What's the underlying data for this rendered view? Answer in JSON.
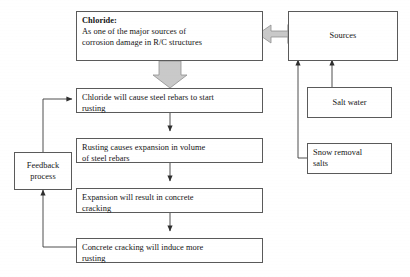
{
  "diagram": {
    "background_color": "#ffffff",
    "box_border_color": "#5a5a5a",
    "connector_color": "#3a3a3a",
    "block_arrow_fill": "#c9c9c9",
    "block_arrow_stroke": "#8a8a8a"
  },
  "chloride_box": {
    "heading": "Chloride:",
    "line1": "As one of the major sources of",
    "line2": "corrosion damage in R/C structures"
  },
  "sources_box": {
    "label": "Sources"
  },
  "salt_water_box": {
    "label": "Salt water"
  },
  "snow_removal_box": {
    "line1": "Snow removal",
    "line2": "salts"
  },
  "feedback_box": {
    "line1": "Feedback",
    "line2": "process"
  },
  "flow_steps": [
    {
      "id": "step-rusting-start",
      "line1": "Chloride will cause steel rebars to start",
      "line2": "rusting"
    },
    {
      "id": "step-expansion-volume",
      "line1": "Rusting causes expansion in volume",
      "line2": "of steel rebars"
    },
    {
      "id": "step-concrete-cracking",
      "line1": "Expansion will result in concrete",
      "line2": "cracking"
    },
    {
      "id": "step-induce-more-rusting",
      "line1": "Concrete cracking will induce more",
      "line2": "rusting"
    }
  ],
  "arrows": {
    "sources_to_chloride": "block-arrow-left",
    "chloride_to_step1": "block-arrow-down",
    "step1_to_step2": "line-arrow-down",
    "step2_to_step3": "line-arrow-down",
    "step3_to_step4": "line-arrow-down",
    "step4_to_feedback": "line-arrow-up",
    "feedback_to_step1": "line-arrow-right",
    "salt_water_to_sources": "line-arrow-up",
    "snow_removal_to_sources": "line-arrow-up"
  }
}
